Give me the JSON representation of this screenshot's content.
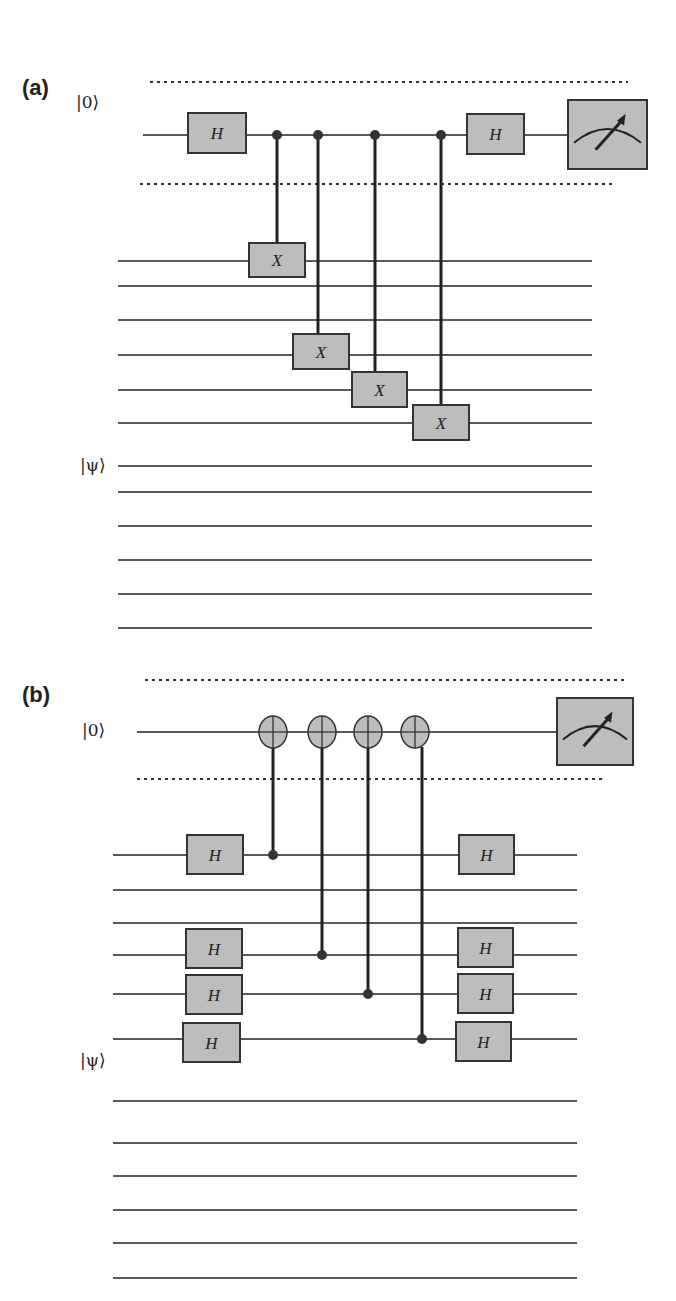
{
  "colors": {
    "wire": "#222222",
    "gate_fill": "#bdbdbd",
    "gate_stroke": "#333333",
    "dots": "#333333"
  },
  "panels": [
    {
      "id": "a",
      "label": "(a)",
      "label_pos": [
        22,
        75
      ],
      "ancilla": {
        "ket": "|0⟩",
        "ket_pos": [
          76,
          92
        ],
        "y": 135,
        "x1": 143,
        "x2": 567
      },
      "dotted_lines": [
        {
          "y": 82,
          "x1": 150,
          "x2": 628
        },
        {
          "y": 184,
          "x1": 140,
          "x2": 615
        }
      ],
      "data_ket": {
        "ket": "|ψ⟩",
        "ket_pos": [
          80,
          455
        ]
      },
      "data_wires": {
        "x1": 118,
        "x2": 592,
        "ys": [
          261,
          286,
          320,
          355,
          390,
          423,
          466,
          492,
          526,
          560,
          594,
          628
        ]
      },
      "gates": [
        {
          "label": "H",
          "x": 188,
          "y": 113,
          "w": 58,
          "h": 40,
          "wire": "ancilla"
        },
        {
          "label": "H",
          "x": 467,
          "y": 114,
          "w": 57,
          "h": 40,
          "wire": "ancilla"
        },
        {
          "label": "X",
          "x": 249,
          "y": 243,
          "w": 56,
          "h": 34
        },
        {
          "label": "X",
          "x": 293,
          "y": 334,
          "w": 56,
          "h": 35
        },
        {
          "label": "X",
          "x": 352,
          "y": 372,
          "w": 55,
          "h": 35
        },
        {
          "label": "X",
          "x": 413,
          "y": 405,
          "w": 56,
          "h": 35
        }
      ],
      "controls": [
        {
          "x": 277,
          "y_dot": 135,
          "y_target": 243,
          "kind": "dot-to-box"
        },
        {
          "x": 318,
          "y_dot": 135,
          "y_target": 334,
          "kind": "dot-to-box"
        },
        {
          "x": 375,
          "y_dot": 135,
          "y_target": 372,
          "kind": "dot-to-box"
        },
        {
          "x": 441,
          "y_dot": 135,
          "y_target": 405,
          "kind": "dot-to-box"
        }
      ],
      "measure": {
        "x": 568,
        "y": 100,
        "w": 79,
        "h": 69
      }
    },
    {
      "id": "b",
      "label": "(b)",
      "label_pos": [
        22,
        682
      ],
      "ancilla": {
        "ket": "|0⟩",
        "ket_pos": [
          82,
          720
        ],
        "y": 732,
        "x1": 137,
        "x2": 557
      },
      "dotted_lines": [
        {
          "y": 680,
          "x1": 145,
          "x2": 625
        },
        {
          "y": 779,
          "x1": 137,
          "x2": 602
        }
      ],
      "data_ket": {
        "ket": "|ψ⟩",
        "ket_pos": [
          80,
          1050
        ]
      },
      "data_wires": {
        "x1": 113,
        "x2": 577,
        "ys": [
          855,
          890,
          923,
          955,
          994,
          1039,
          1101,
          1143,
          1176,
          1210,
          1243,
          1278
        ]
      },
      "gates": [
        {
          "label": "H",
          "x": 187,
          "y": 835,
          "w": 56,
          "h": 39
        },
        {
          "label": "H",
          "x": 459,
          "y": 835,
          "w": 55,
          "h": 39
        },
        {
          "label": "H",
          "x": 186,
          "y": 929,
          "w": 56,
          "h": 39
        },
        {
          "label": "H",
          "x": 458,
          "y": 928,
          "w": 55,
          "h": 39
        },
        {
          "label": "H",
          "x": 186,
          "y": 975,
          "w": 56,
          "h": 39
        },
        {
          "label": "H",
          "x": 458,
          "y": 974,
          "w": 55,
          "h": 39
        },
        {
          "label": "H",
          "x": 183,
          "y": 1023,
          "w": 57,
          "h": 39
        },
        {
          "label": "H",
          "x": 456,
          "y": 1022,
          "w": 55,
          "h": 39
        }
      ],
      "targets": [
        {
          "x": 273,
          "y": 732,
          "r": 15
        },
        {
          "x": 322,
          "y": 732,
          "r": 15
        },
        {
          "x": 368,
          "y": 732,
          "r": 15
        },
        {
          "x": 415,
          "y": 732,
          "r": 15
        }
      ],
      "controls": [
        {
          "x": 273,
          "y_dot": 855,
          "y_target": 747,
          "kind": "dot-to-oplus"
        },
        {
          "x": 322,
          "y_dot": 955,
          "y_target": 747,
          "kind": "dot-to-oplus"
        },
        {
          "x": 368,
          "y_dot": 994,
          "y_target": 747,
          "kind": "dot-to-oplus"
        },
        {
          "x": 422,
          "y_dot": 1039,
          "y_target": 747,
          "kind": "dot-to-oplus"
        }
      ],
      "measure": {
        "x": 557,
        "y": 698,
        "w": 76,
        "h": 67
      }
    }
  ]
}
